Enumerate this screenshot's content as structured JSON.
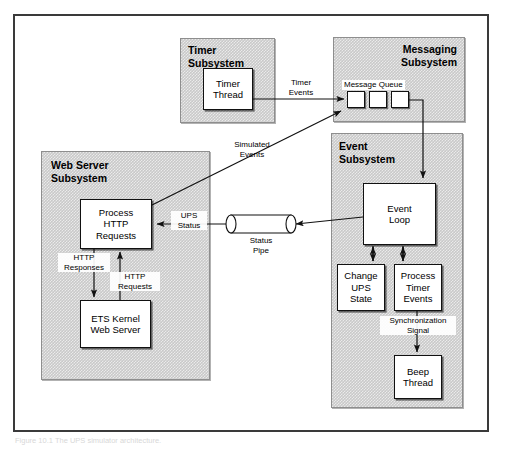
{
  "figure": {
    "caption": "Figure 10.1  The UPS simulator architecture."
  },
  "subsystems": [
    {
      "id": "timer",
      "title": "Timer\nSubsystem"
    },
    {
      "id": "messaging",
      "title": "Messaging\nSubsystem"
    },
    {
      "id": "event",
      "title": "Event\nSubsystem"
    },
    {
      "id": "webserver",
      "title": "Web Server\nSubsystem"
    }
  ],
  "boxes": {
    "timer_thread": "Timer\nThread",
    "event_loop": "Event\nLoop",
    "change_ups": "Change\nUPS\nState",
    "process_timer": "Process\nTimer\nEvents",
    "beep_thread": "Beep\nThread",
    "process_http": "Process\nHTTP\nRequests",
    "ets_kernel": "ETS Kernel\nWeb Server"
  },
  "message_queue": {
    "caption": "Message Queue",
    "cells": [
      "",
      "",
      ""
    ]
  },
  "pipe": {
    "label": "Status\nPipe"
  },
  "edge_labels": {
    "timer_events": "Timer\nEvents",
    "simulated_events": "Simulated\nEvents",
    "ups_status": "UPS\nStatus",
    "http_responses": "HTTP\nResponses",
    "http_requests": "HTTP\nRequests",
    "sync_signal": "Synchronization\nSignal"
  },
  "colors": {
    "frame": "#3a3a3a",
    "subsystem_fill": "#c9c9c9",
    "box_fill": "#ffffff",
    "stroke": "#111111"
  }
}
